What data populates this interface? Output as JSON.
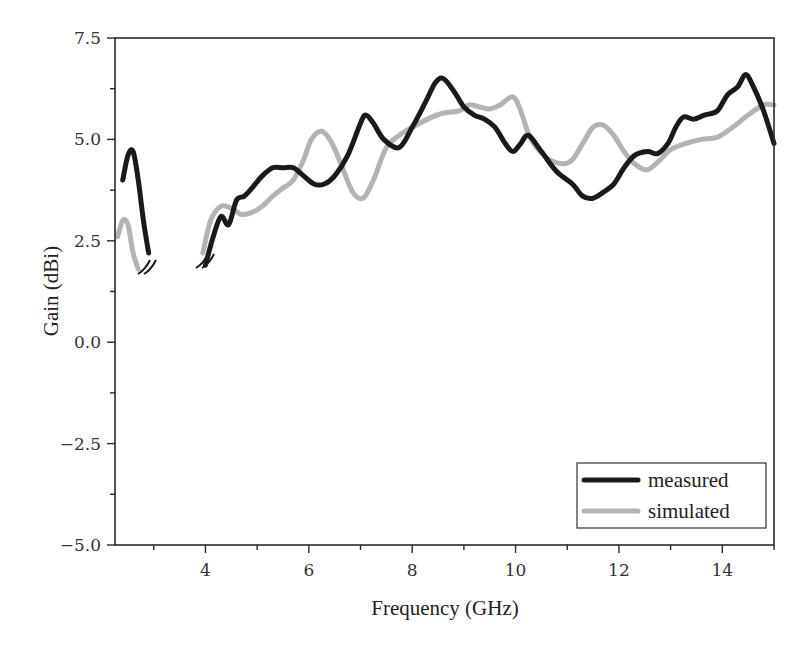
{
  "chart_data": {
    "type": "line",
    "title": "",
    "xlabel": "Frequency (GHz)",
    "ylabel": "Gain (dBi)",
    "xlim": [
      2.25,
      15
    ],
    "ylim": [
      -5.0,
      7.5
    ],
    "xticks": [
      4,
      6,
      8,
      10,
      12,
      14
    ],
    "xtick_labels": [
      "4",
      "6",
      "8",
      "10",
      "12",
      "14"
    ],
    "yticks": [
      -5.0,
      -2.5,
      0.0,
      2.5,
      5.0,
      7.5
    ],
    "ytick_labels": [
      "-5.0",
      "-2.5",
      "0.0",
      "2.5",
      "5.0",
      "7.5"
    ],
    "grid": false,
    "legend_position": "lower right",
    "axis_break": {
      "from": 3.0,
      "to": 3.9,
      "note": "curves interrupted with double-slash break marks between ~3 and ~4 GHz"
    },
    "series": [
      {
        "name": "measured",
        "color": "#1a1a1a",
        "segments": [
          {
            "x": [
              2.4,
              2.5,
              2.6,
              2.7,
              2.8,
              2.9
            ],
            "y": [
              4.0,
              4.6,
              4.7,
              4.0,
              3.0,
              2.2
            ]
          },
          {
            "x": [
              4.0,
              4.15,
              4.3,
              4.45,
              4.6,
              4.75,
              4.9,
              5.1,
              5.3,
              5.5,
              5.7,
              5.9,
              6.1,
              6.3,
              6.5,
              6.75,
              7.0,
              7.1,
              7.25,
              7.45,
              7.75,
              8.0,
              8.25,
              8.45,
              8.6,
              8.8,
              9.0,
              9.2,
              9.4,
              9.6,
              9.8,
              9.95,
              10.1,
              10.25,
              10.5,
              10.8,
              11.1,
              11.3,
              11.5,
              11.7,
              11.9,
              12.1,
              12.3,
              12.55,
              12.75,
              12.95,
              13.1,
              13.25,
              13.45,
              13.65,
              13.9,
              14.1,
              14.3,
              14.45,
              14.6,
              14.8,
              15.0
            ],
            "y": [
              1.9,
              2.6,
              3.1,
              2.9,
              3.5,
              3.6,
              3.8,
              4.1,
              4.3,
              4.3,
              4.3,
              4.1,
              3.9,
              3.9,
              4.1,
              4.6,
              5.4,
              5.6,
              5.4,
              5.0,
              4.8,
              5.3,
              5.9,
              6.4,
              6.5,
              6.2,
              5.8,
              5.6,
              5.5,
              5.3,
              4.9,
              4.7,
              4.9,
              5.1,
              4.7,
              4.2,
              3.9,
              3.6,
              3.55,
              3.7,
              3.9,
              4.3,
              4.6,
              4.7,
              4.65,
              4.9,
              5.3,
              5.55,
              5.5,
              5.6,
              5.7,
              6.1,
              6.3,
              6.6,
              6.3,
              5.7,
              4.9
            ]
          }
        ]
      },
      {
        "name": "simulated",
        "color": "#b3b3b3",
        "segments": [
          {
            "x": [
              2.3,
              2.4,
              2.5,
              2.6,
              2.7
            ],
            "y": [
              2.6,
              3.0,
              2.9,
              2.2,
              1.8
            ]
          },
          {
            "x": [
              3.95,
              4.1,
              4.3,
              4.5,
              4.7,
              4.9,
              5.1,
              5.3,
              5.5,
              5.7,
              5.9,
              6.05,
              6.25,
              6.45,
              6.65,
              6.85,
              7.05,
              7.25,
              7.5,
              7.75,
              8.0,
              8.3,
              8.6,
              8.9,
              9.1,
              9.3,
              9.5,
              9.7,
              9.95,
              10.1,
              10.3,
              10.6,
              10.9,
              11.1,
              11.3,
              11.5,
              11.7,
              11.9,
              12.1,
              12.3,
              12.55,
              12.8,
              13.0,
              13.3,
              13.6,
              13.9,
              14.2,
              14.5,
              14.8,
              15.0
            ],
            "y": [
              2.2,
              3.0,
              3.35,
              3.3,
              3.15,
              3.2,
              3.35,
              3.6,
              3.8,
              4.0,
              4.5,
              5.0,
              5.2,
              4.9,
              4.3,
              3.7,
              3.55,
              4.0,
              4.8,
              5.1,
              5.3,
              5.5,
              5.65,
              5.7,
              5.85,
              5.8,
              5.75,
              5.85,
              6.05,
              5.7,
              5.0,
              4.55,
              4.4,
              4.5,
              4.9,
              5.3,
              5.35,
              5.1,
              4.7,
              4.4,
              4.25,
              4.5,
              4.75,
              4.9,
              5.0,
              5.05,
              5.3,
              5.6,
              5.85,
              5.85
            ]
          }
        ]
      }
    ]
  },
  "legend": {
    "items": [
      {
        "label": "measured",
        "color": "#1a1a1a"
      },
      {
        "label": "simulated",
        "color": "#b3b3b3"
      }
    ]
  }
}
